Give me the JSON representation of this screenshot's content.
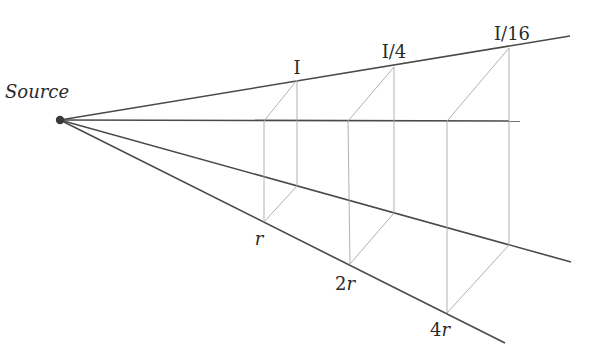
{
  "diagram": {
    "source_label": "Source",
    "intensity_labels": [
      "I",
      "I/4",
      "I/16"
    ],
    "distance_labels": [
      {
        "num": "",
        "var": "r"
      },
      {
        "num": "2",
        "var": "r"
      },
      {
        "num": "4",
        "var": "r"
      }
    ],
    "colors": {
      "ray": "#4a4a4a",
      "guide": "#a8a8a8",
      "source_dot": "#3a3a3a",
      "text": "#2a2a2a"
    }
  }
}
